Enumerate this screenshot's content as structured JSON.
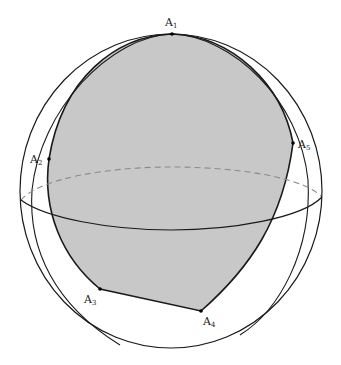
{
  "figure": {
    "colors": {
      "polygon_fill": "#c8c8c8",
      "outline": "#1a1a1a",
      "equator_back": "#8a8a8a",
      "background": "#ffffff"
    }
  },
  "vertices": [
    {
      "name": "A",
      "sub": "1",
      "x": 172,
      "y": 34
    },
    {
      "name": "A",
      "sub": "2",
      "x": 49,
      "y": 159
    },
    {
      "name": "A",
      "sub": "3",
      "x": 100,
      "y": 289
    },
    {
      "name": "A",
      "sub": "4",
      "x": 201,
      "y": 311
    },
    {
      "name": "A",
      "sub": "5",
      "x": 293,
      "y": 143
    }
  ],
  "labels": [
    {
      "text": "A",
      "sub": "1",
      "x": 165,
      "y": 26
    },
    {
      "text": "A",
      "sub": "2",
      "x": 30,
      "y": 163
    },
    {
      "text": "A",
      "sub": "3",
      "x": 84,
      "y": 303
    },
    {
      "text": "A",
      "sub": "4",
      "x": 203,
      "y": 325
    },
    {
      "text": "A",
      "sub": "5",
      "x": 298,
      "y": 148
    }
  ]
}
